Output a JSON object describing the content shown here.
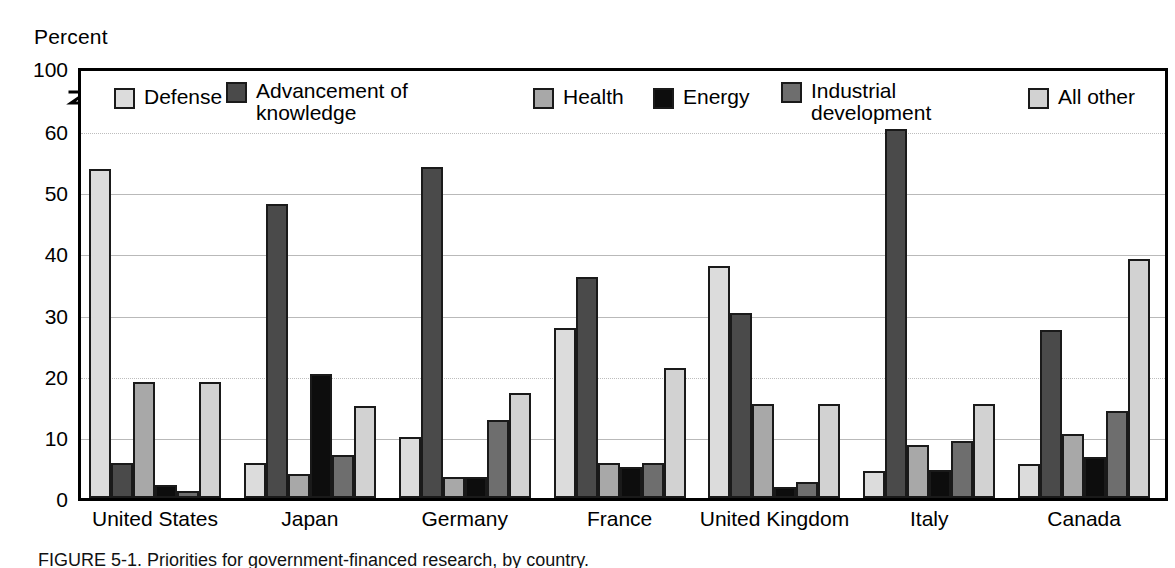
{
  "axis": {
    "unit_label": "Percent",
    "y_ticks": [
      "100",
      "60",
      "50",
      "40",
      "30",
      "20",
      "10",
      "0"
    ],
    "break_marker": "axis-break"
  },
  "legend": {
    "items": [
      {
        "label": "Defense",
        "label_line2": "",
        "key": "defense",
        "color": "#dcdcdc"
      },
      {
        "label": "Advancement of",
        "label_line2": "knowledge",
        "key": "advancement",
        "color": "#4a4a4a"
      },
      {
        "label": "Health",
        "label_line2": "",
        "key": "health",
        "color": "#a8a8a8"
      },
      {
        "label": "Energy",
        "label_line2": "",
        "key": "energy",
        "color": "#0d0d0d"
      },
      {
        "label": "Industrial",
        "label_line2": "development",
        "key": "industrial",
        "color": "#6e6e6e"
      },
      {
        "label": "All other",
        "label_line2": "",
        "key": "allother",
        "color": "#d2d2d2"
      }
    ]
  },
  "caption": {
    "text": "FIGURE 5-1. Priorities for government-financed research, by country."
  },
  "chart_data": {
    "type": "bar",
    "title": "",
    "xlabel": "",
    "ylabel": "Percent",
    "ylim": [
      0,
      62
    ],
    "y_axis_note": "Axis is broken between 60 and 100; top of frame labeled 100.",
    "grid": true,
    "legend_position": "top-inside",
    "categories": [
      "United States",
      "Japan",
      "Germany",
      "France",
      "United Kingdom",
      "Italy",
      "Canada"
    ],
    "series": [
      {
        "name": "Defense",
        "values": [
          53.8,
          5.8,
          10.0,
          27.8,
          38.0,
          4.4,
          5.5
        ]
      },
      {
        "name": "Advancement of knowledge",
        "values": [
          5.8,
          48.0,
          54.1,
          36.2,
          30.2,
          60.3,
          27.4
        ]
      },
      {
        "name": "Health",
        "values": [
          19.0,
          4.0,
          3.4,
          5.8,
          15.3,
          8.7,
          10.4
        ]
      },
      {
        "name": "Energy",
        "values": [
          2.2,
          20.2,
          3.4,
          5.1,
          1.8,
          4.6,
          6.7
        ]
      },
      {
        "name": "Industrial development",
        "values": [
          1.2,
          7.0,
          12.8,
          5.8,
          2.7,
          9.3,
          14.2
        ]
      },
      {
        "name": "All other",
        "values": [
          19.0,
          15.0,
          17.1,
          21.2,
          15.3,
          15.3,
          39.0
        ]
      }
    ]
  }
}
